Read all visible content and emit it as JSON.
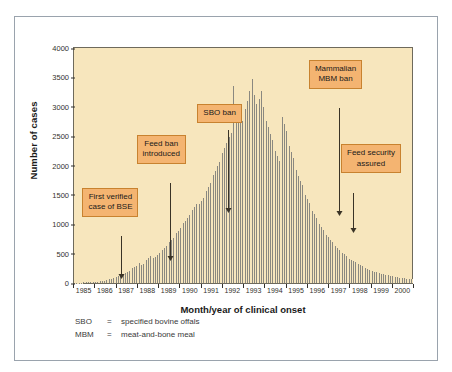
{
  "chart_data": {
    "type": "bar",
    "title": "",
    "xlabel": "Month/year of clinical onset",
    "ylabel": "Number of cases",
    "ylim": [
      0,
      4000
    ],
    "ytick_labels": [
      "0",
      "500",
      "1000",
      "1500",
      "2000",
      "2500",
      "3000",
      "3500",
      "4000"
    ],
    "ytick_values": [
      0,
      500,
      1000,
      1500,
      2000,
      2500,
      3000,
      3500,
      4000
    ],
    "xtick_labels": [
      "1985",
      "1986",
      "1987",
      "1988",
      "1989",
      "1990",
      "1991",
      "1992",
      "1993",
      "1994",
      "1995",
      "1996",
      "1997",
      "1998",
      "1999",
      "2000"
    ],
    "x_unit": "month",
    "grid": false,
    "legend": "none",
    "bar_color": "#8a8880",
    "plot_background": "#f7e6bd",
    "series_name": "Confirmed BSE cases by month of clinical onset",
    "values": [
      4,
      6,
      5,
      8,
      7,
      10,
      9,
      12,
      11,
      14,
      13,
      16,
      18,
      22,
      26,
      30,
      34,
      40,
      46,
      52,
      60,
      68,
      78,
      88,
      100,
      112,
      126,
      140,
      156,
      172,
      190,
      210,
      230,
      252,
      274,
      298,
      322,
      348,
      300,
      330,
      360,
      392,
      424,
      458,
      470,
      420,
      448,
      476,
      505,
      535,
      566,
      598,
      631,
      665,
      700,
      736,
      773,
      811,
      850,
      890,
      931,
      973,
      1016,
      1060,
      1105,
      1151,
      1198,
      1246,
      1295,
      1345,
      1280,
      1340,
      1396,
      1450,
      1510,
      1572,
      1636,
      1702,
      1770,
      1840,
      1912,
      1986,
      2062,
      2140,
      2220,
      2302,
      2386,
      3110,
      2480,
      2560,
      3360,
      2700,
      2800,
      2900,
      3030,
      2760,
      2860,
      2960,
      3100,
      3260,
      3420,
      3480,
      3200,
      3050,
      2980,
      3140,
      3260,
      3000,
      2880,
      2760,
      2650,
      2540,
      2440,
      2340,
      2250,
      2160,
      2080,
      2000,
      2820,
      2700,
      2580,
      2460,
      2340,
      2230,
      2120,
      2020,
      1920,
      1830,
      1740,
      1660,
      1580,
      1500,
      1430,
      1360,
      1290,
      1230,
      1170,
      1110,
      1050,
      1000,
      950,
      900,
      860,
      820,
      780,
      740,
      700,
      665,
      630,
      600,
      570,
      540,
      512,
      486,
      460,
      436,
      414,
      392,
      372,
      352,
      334,
      317,
      300,
      285,
      270,
      256,
      243,
      230,
      218,
      207,
      196,
      186,
      176,
      167,
      158,
      150,
      142,
      135,
      128,
      121,
      115,
      109,
      103,
      98,
      93,
      88,
      83,
      79,
      75,
      71,
      67,
      60
    ]
  },
  "annotations": [
    {
      "id": "first-verified-case",
      "lines": [
        "First verified",
        "case of BSE"
      ]
    },
    {
      "id": "feed-ban-introduced",
      "lines": [
        "Feed ban",
        "introduced"
      ]
    },
    {
      "id": "sbo-ban",
      "lines": [
        "SBO ban"
      ]
    },
    {
      "id": "mammalian-mbm-ban",
      "lines": [
        "Mammalian",
        "MBM ban"
      ]
    },
    {
      "id": "feed-security-assured",
      "lines": [
        "Feed security",
        "assured"
      ]
    }
  ],
  "annotation_text": {
    "first_verified_1": "First verified",
    "first_verified_2": "case of BSE",
    "feed_ban_1": "Feed ban",
    "feed_ban_2": "introduced",
    "sbo_ban": "SBO ban",
    "mbm_ban_1": "Mammalian",
    "mbm_ban_2": "MBM ban",
    "feed_security_1": "Feed security",
    "feed_security_2": "assured"
  },
  "footnotes": [
    {
      "key": "SBO",
      "eq": "=",
      "text": "specified bovine offals"
    },
    {
      "key": "MBM",
      "eq": "=",
      "text": "meat-and-bone meal"
    }
  ]
}
